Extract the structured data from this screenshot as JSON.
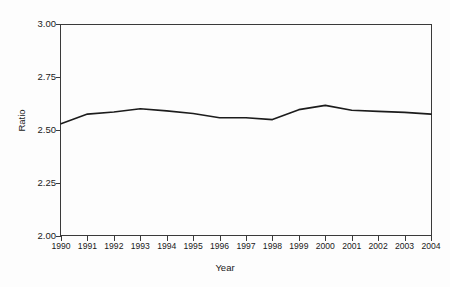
{
  "chart_data": {
    "type": "line",
    "title": "",
    "subtitle": "",
    "xlabel": "Year",
    "ylabel": "Ratio",
    "categories": [
      "1990",
      "1991",
      "1992",
      "1993",
      "1994",
      "1995",
      "1996",
      "1997",
      "1998",
      "1999",
      "2000",
      "2001",
      "2002",
      "2003",
      "2004"
    ],
    "x": [
      1990,
      1991,
      1992,
      1993,
      1994,
      1995,
      1996,
      1997,
      1998,
      1999,
      2000,
      2001,
      2002,
      2003,
      2004
    ],
    "series": [
      {
        "name": "Ratio",
        "values": [
          2.53,
          2.575,
          2.585,
          2.6,
          2.59,
          2.578,
          2.558,
          2.558,
          2.549,
          2.596,
          2.616,
          2.593,
          2.588,
          2.583,
          2.575
        ]
      }
    ],
    "ylim": [
      2.0,
      3.0
    ],
    "yticks": [
      2.0,
      2.25,
      2.5,
      2.75,
      3.0
    ],
    "ytick_labels": [
      "2.00",
      "2.25",
      "2.50",
      "2.75",
      "3.00"
    ],
    "xlim": [
      1990,
      2004
    ],
    "grid": false,
    "legend": false,
    "legend_position": "none",
    "line_color": "#1c1c1c",
    "axis_color": "#3a3a3a",
    "background_color": "#fdfdfd"
  }
}
